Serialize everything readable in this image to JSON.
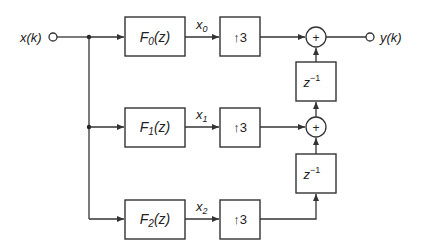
{
  "diagram": {
    "type": "polyphase filter bank block diagram",
    "input": {
      "label": "x(k)"
    },
    "output": {
      "label": "y(k)"
    },
    "branches": [
      {
        "filter": {
          "name": "F",
          "sub": "0",
          "arg": "(z)"
        },
        "signal": {
          "name": "x",
          "sub": "0"
        },
        "upsampler": "↑3"
      },
      {
        "filter": {
          "name": "F",
          "sub": "1",
          "arg": "(z)"
        },
        "signal": {
          "name": "x",
          "sub": "1"
        },
        "upsampler": "↑3"
      },
      {
        "filter": {
          "name": "F",
          "sub": "2",
          "arg": "(z)"
        },
        "signal": {
          "name": "x",
          "sub": "2"
        },
        "upsampler": "↑3"
      }
    ],
    "delays": [
      {
        "base": "z",
        "exp": "−1"
      },
      {
        "base": "z",
        "exp": "−1"
      }
    ],
    "adders": [
      {
        "symbol": "+"
      },
      {
        "symbol": "+"
      }
    ],
    "colors": {
      "line": "#333333",
      "text": "#222222",
      "background": "#ffffff"
    }
  }
}
